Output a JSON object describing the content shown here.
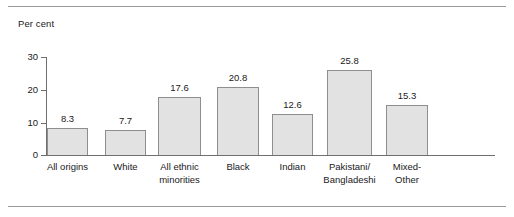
{
  "figure": {
    "axis_title": "Per cent",
    "colors": {
      "bar_fill": "#e2e2e2",
      "bar_stroke": "#8e8e8e",
      "axis": "#6f6f6f",
      "rule": "#9a9a9a",
      "text": "#1a1a1a"
    }
  },
  "chart_data": {
    "type": "bar",
    "title": "",
    "subtitle": "",
    "xlabel": "",
    "ylabel": "Per cent",
    "ylim": [
      0,
      30
    ],
    "yticks": [
      0,
      10,
      20,
      30
    ],
    "ytick_labels": [
      "0",
      "10",
      "20",
      "30"
    ],
    "grid": false,
    "legend": null,
    "categories": [
      "All origins",
      "White",
      "All ethnic minorities",
      "Black",
      "Indian",
      "Pakistani/ Bangladeshi",
      "Mixed-Other"
    ],
    "category_label_lines": [
      [
        "All origins"
      ],
      [
        "White"
      ],
      [
        "All ethnic",
        "minorities"
      ],
      [
        "Black"
      ],
      [
        "Indian"
      ],
      [
        "Pakistani/",
        "Bangladeshi"
      ],
      [
        "Mixed-",
        "Other"
      ]
    ],
    "values": [
      8.3,
      7.7,
      17.6,
      20.8,
      12.6,
      25.8,
      15.3
    ],
    "value_labels": [
      "8.3",
      "7.7",
      "17.6",
      "20.8",
      "12.6",
      "25.8",
      "15.3"
    ]
  },
  "bars": [
    {
      "label": "All origins",
      "value_label": "8.3",
      "left": 47,
      "width": 41,
      "top": 128,
      "height": 27,
      "line1": "All origins",
      "line2": ""
    },
    {
      "label": "White",
      "value_label": "7.7",
      "left": 105,
      "width": 41,
      "top": 130,
      "height": 25,
      "line1": "White",
      "line2": ""
    },
    {
      "label": "All ethnic minorities",
      "value_label": "17.6",
      "left": 158,
      "width": 43,
      "top": 97,
      "height": 58,
      "line1": "All ethnic",
      "line2": "minorities"
    },
    {
      "label": "Black",
      "value_label": "20.8",
      "left": 217,
      "width": 42,
      "top": 87,
      "height": 68,
      "line1": "Black",
      "line2": ""
    },
    {
      "label": "Indian",
      "value_label": "12.6",
      "left": 272,
      "width": 41,
      "top": 114,
      "height": 41,
      "line1": "Indian",
      "line2": ""
    },
    {
      "label": "Pakistani/ Bangladeshi",
      "value_label": "25.8",
      "left": 327,
      "width": 45,
      "top": 70,
      "height": 85,
      "line1": "Pakistani/",
      "line2": "Bangladeshi"
    },
    {
      "label": "Mixed-Other",
      "value_label": "15.3",
      "left": 386,
      "width": 42,
      "top": 105,
      "height": 50,
      "line1": "Mixed-",
      "line2": "Other"
    }
  ],
  "yticks": [
    {
      "label": "30",
      "top": 57
    },
    {
      "label": "20",
      "top": 90
    },
    {
      "label": "10",
      "top": 123
    },
    {
      "label": "0",
      "top": 155
    }
  ]
}
